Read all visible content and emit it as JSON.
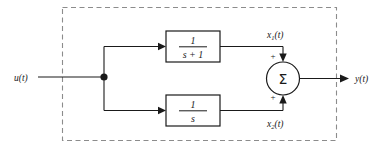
{
  "diagram": {
    "type": "control-system-block-diagram",
    "colors": {
      "line": "#1a1a1a",
      "dashed_border": "#8c8c8c",
      "background": "#ffffff"
    },
    "input": {
      "label": "u(t)",
      "base": "u",
      "arg": "(t)"
    },
    "output": {
      "label": "y(t)",
      "base": "y",
      "arg": "(t)"
    },
    "branch_node": {
      "name": "branch-point"
    },
    "blocks": [
      {
        "id": "block-top",
        "numerator": "1",
        "denominator": "s + 1",
        "transfer_function": "1/(s+1)",
        "output_signal": "x1(t)",
        "output_base": "x",
        "output_subscript": "1",
        "output_arg": "(t)",
        "sign_into_summer": "+"
      },
      {
        "id": "block-bottom",
        "numerator": "1",
        "denominator": "s",
        "transfer_function": "1/s",
        "output_signal": "x2(t)",
        "output_base": "x",
        "output_subscript": "2",
        "output_arg": "(t)",
        "sign_into_summer": "+"
      }
    ],
    "summer": {
      "symbol": "Σ",
      "name": "summing-junction",
      "input_signs": [
        "+",
        "+"
      ]
    },
    "boundary": {
      "style": "dashed",
      "name": "system-boundary"
    }
  }
}
